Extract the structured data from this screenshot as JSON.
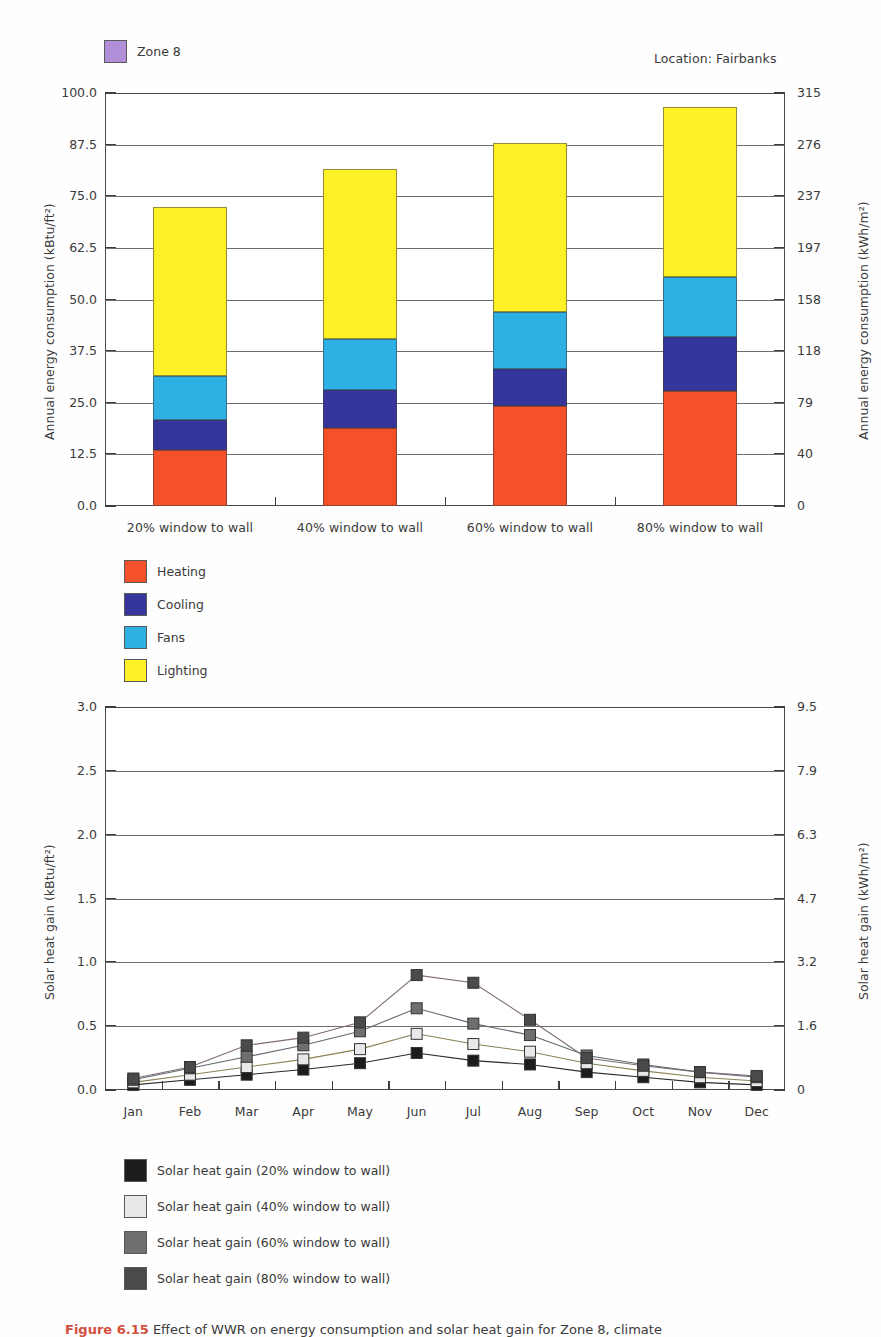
{
  "meta": {
    "zone_legend_label": "Zone 8",
    "zone_legend_color": "#b08fd8",
    "location_label": "Location:  Fairbanks"
  },
  "chart_data": [
    {
      "type": "bar",
      "stacked": true,
      "title": "Annual energy consumption by window-to-wall ratio — Zone 8, Fairbanks",
      "categories": [
        "20% window to wall",
        "40% window to wall",
        "60% window to wall",
        "80% window to wall"
      ],
      "series": [
        {
          "name": "Heating",
          "color": "#f4502a",
          "values": [
            13.5,
            19.0,
            24.2,
            27.8
          ]
        },
        {
          "name": "Cooling",
          "color": "#36359b",
          "values": [
            7.4,
            9.2,
            9.0,
            13.2
          ]
        },
        {
          "name": "Fans",
          "color": "#2fb0e4",
          "values": [
            10.6,
            12.3,
            13.8,
            14.5
          ]
        },
        {
          "name": "Lighting",
          "color": "#fdf024",
          "values": [
            41.0,
            41.0,
            41.0,
            41.0
          ]
        }
      ],
      "totals": [
        72.5,
        81.5,
        88.0,
        96.5
      ],
      "ylabel": "Annual energy consumption (kBtu/ft²)",
      "ylabel_right": "Annual energy consumption (kWh/m²)",
      "xlabel": "",
      "ylim": [
        0,
        100
      ],
      "yticks": [
        "0.0",
        "12.5",
        "25.0",
        "37.5",
        "50.0",
        "62.5",
        "75.0",
        "87.5",
        "100.0"
      ],
      "yticks_right": [
        "0",
        "40",
        "79",
        "118",
        "158",
        "197",
        "237",
        "276",
        "315"
      ],
      "ylim_right": [
        0,
        315
      ],
      "grid": true,
      "legend": [
        {
          "label": "Heating",
          "color": "#f4502a"
        },
        {
          "label": "Cooling",
          "color": "#36359b"
        },
        {
          "label": "Fans",
          "color": "#2fb0e4"
        },
        {
          "label": "Lighting",
          "color": "#fdf024"
        }
      ]
    },
    {
      "type": "line",
      "title": "Monthly solar heat gain by window-to-wall ratio — Zone 8, Fairbanks",
      "x": [
        "Jan",
        "Feb",
        "Mar",
        "Apr",
        "May",
        "Jun",
        "Jul",
        "Aug",
        "Sep",
        "Oct",
        "Nov",
        "Dec"
      ],
      "series": [
        {
          "name": "Solar heat gain (20% window to wall)",
          "color": "#1c1c1c",
          "marker": "filled-black-square",
          "values": [
            0.04,
            0.08,
            0.12,
            0.16,
            0.21,
            0.29,
            0.23,
            0.2,
            0.14,
            0.1,
            0.06,
            0.04
          ]
        },
        {
          "name": "Solar heat gain (40% window to wall)",
          "color": "#e8e8e8",
          "marker": "open-white-square",
          "values": [
            0.06,
            0.12,
            0.18,
            0.24,
            0.32,
            0.44,
            0.36,
            0.3,
            0.21,
            0.15,
            0.1,
            0.07
          ]
        },
        {
          "name": "Solar heat gain (60% window to wall)",
          "color": "#6f6f6f",
          "marker": "mid-gray-square",
          "values": [
            0.08,
            0.17,
            0.26,
            0.35,
            0.46,
            0.64,
            0.52,
            0.43,
            0.27,
            0.2,
            0.14,
            0.1
          ]
        },
        {
          "name": "Solar heat gain (80% window to wall)",
          "color": "#4a4a4a",
          "marker": "dark-gray-square",
          "values": [
            0.09,
            0.18,
            0.35,
            0.41,
            0.53,
            0.9,
            0.84,
            0.55,
            0.25,
            0.19,
            0.14,
            0.11
          ]
        }
      ],
      "ylabel": "Solar heat gain (kBtu/ft²)",
      "ylabel_right": "Solar heat gain (kWh/m²)",
      "xlabel": "",
      "ylim": [
        0,
        3.0
      ],
      "yticks": [
        "0.0",
        "0.5",
        "1.0",
        "1.5",
        "2.0",
        "2.5",
        "3.0"
      ],
      "yticks_right": [
        "0",
        "1.6",
        "3.2",
        "4.7",
        "6.3",
        "7.9",
        "9.5"
      ],
      "ylim_right": [
        0,
        9.5
      ],
      "grid": true,
      "legend": [
        {
          "label": "Solar heat gain (20% window to wall)",
          "color": "#1c1c1c"
        },
        {
          "label": "Solar heat gain (40% window to wall)",
          "color": "#e8e8e8"
        },
        {
          "label": "Solar heat gain (60% window to wall)",
          "color": "#6f6f6f"
        },
        {
          "label": "Solar heat gain (80% window to wall)",
          "color": "#4a4a4a"
        }
      ]
    }
  ],
  "caption": {
    "figure_number": "Figure 6.15",
    "text": "Effect of WWR on energy consumption and solar heat gain for Zone 8, climate"
  }
}
